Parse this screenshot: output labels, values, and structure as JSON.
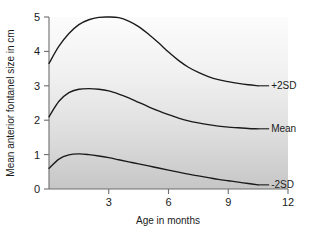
{
  "chart_data": {
    "type": "line",
    "title": "",
    "xlabel": "Age in months",
    "ylabel": "Mean anterior fontanel size in cm",
    "xlim": [
      0,
      12
    ],
    "ylim": [
      0,
      5
    ],
    "xticks": [
      "3",
      "6",
      "9",
      "12"
    ],
    "xtick_values": [
      3,
      6,
      9,
      12
    ],
    "yticks": [
      "0",
      "1",
      "2",
      "3",
      "4",
      "5"
    ],
    "ytick_values": [
      0,
      1,
      2,
      3,
      4,
      5
    ],
    "grid": false,
    "legend_position": "right-inline-labels",
    "background": "vertical-gradient-light-to-gray",
    "x": [
      0,
      0.5,
      1,
      1.5,
      2,
      2.5,
      3,
      3.5,
      4,
      4.5,
      5,
      5.5,
      6,
      6.5,
      7,
      7.5,
      8,
      8.5,
      9,
      9.5,
      10,
      10.5
    ],
    "series": [
      {
        "name": "+2SD",
        "label": "+2SD",
        "values": [
          3.65,
          4.15,
          4.52,
          4.78,
          4.92,
          4.99,
          5.0,
          4.98,
          4.88,
          4.72,
          4.5,
          4.25,
          3.98,
          3.74,
          3.54,
          3.39,
          3.27,
          3.18,
          3.12,
          3.07,
          3.03,
          3.0
        ]
      },
      {
        "name": "Mean",
        "label": "Mean",
        "values": [
          2.1,
          2.55,
          2.8,
          2.9,
          2.92,
          2.9,
          2.85,
          2.76,
          2.65,
          2.52,
          2.39,
          2.27,
          2.16,
          2.06,
          1.98,
          1.92,
          1.87,
          1.83,
          1.8,
          1.78,
          1.76,
          1.75
        ]
      },
      {
        "name": "-2SD",
        "label": "-2SD",
        "values": [
          0.6,
          0.87,
          0.99,
          1.02,
          1.0,
          0.96,
          0.91,
          0.85,
          0.79,
          0.73,
          0.67,
          0.61,
          0.55,
          0.49,
          0.43,
          0.38,
          0.33,
          0.28,
          0.24,
          0.2,
          0.16,
          0.12
        ]
      }
    ],
    "colors": {
      "curve": "#1a1a1a",
      "axis": "#6e6e6e",
      "text": "#1a1a1a",
      "plot_background_top": "#fbfbfb",
      "plot_background_bottom": "#c9c9c9"
    }
  },
  "axes": {
    "x_title": "Age in months",
    "y_title": "Mean anterior fontanel size in cm",
    "x_tick_labels": [
      "3",
      "6",
      "9",
      "12"
    ],
    "y_tick_labels": [
      "0",
      "1",
      "2",
      "3",
      "4",
      "5"
    ]
  },
  "series_labels": {
    "upper": "+2SD",
    "middle": "Mean",
    "lower": "-2SD"
  }
}
